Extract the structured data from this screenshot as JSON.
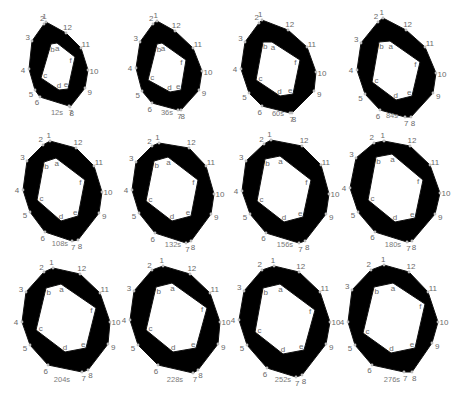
{
  "figure": {
    "title": "",
    "ring_color": "#000000",
    "label_color": "#6a6a6a",
    "outer_vertex_labels": [
      "1",
      "2",
      "3",
      "4",
      "5",
      "6",
      "7",
      "8",
      "9",
      "10",
      "11",
      "12"
    ],
    "inner_vertex_labels": [
      "a",
      "b",
      "c",
      "d",
      "e",
      "f"
    ],
    "panels": [
      {
        "time": "12s",
        "label_pos": [
          57,
          115
        ],
        "outer": [
          [
            46,
            22
          ],
          [
            44,
            24
          ],
          [
            32,
            41
          ],
          [
            29,
            69
          ],
          [
            35,
            90
          ],
          [
            40,
            97
          ],
          [
            69,
            106
          ],
          [
            70,
            107
          ],
          [
            85,
            88
          ],
          [
            88,
            70
          ],
          [
            81,
            48
          ],
          [
            66,
            33
          ]
        ],
        "inner": [
          [
            57,
            43
          ],
          [
            51,
            44
          ],
          [
            41,
            78
          ],
          [
            59,
            90
          ],
          [
            68,
            89
          ],
          [
            75,
            57
          ]
        ]
      },
      {
        "time": "36s",
        "label_pos": [
          167,
          115
        ],
        "outer": [
          [
            157,
            21
          ],
          [
            153,
            24
          ],
          [
            140,
            42
          ],
          [
            136,
            68
          ],
          [
            142,
            91
          ],
          [
            152,
            103
          ],
          [
            178,
            110
          ],
          [
            181,
            110
          ],
          [
            199,
            90
          ],
          [
            202,
            71
          ],
          [
            193,
            48
          ],
          [
            175,
            31
          ]
        ],
        "inner": [
          [
            162,
            43
          ],
          [
            157,
            44
          ],
          [
            148,
            80
          ],
          [
            170,
            92
          ],
          [
            181,
            90
          ],
          [
            186,
            60
          ]
        ]
      },
      {
        "time": "60s",
        "label_pos": [
          278,
          116
        ],
        "outer": [
          [
            262,
            20
          ],
          [
            259,
            23
          ],
          [
            245,
            42
          ],
          [
            241,
            69
          ],
          [
            249,
            93
          ],
          [
            262,
            106
          ],
          [
            290,
            113
          ],
          [
            292,
            113
          ],
          [
            314,
            91
          ],
          [
            316,
            72
          ],
          [
            307,
            47
          ],
          [
            288,
            30
          ]
        ],
        "inner": [
          [
            272,
            42
          ],
          [
            263,
            42
          ],
          [
            256,
            80
          ],
          [
            280,
            96
          ],
          [
            293,
            94
          ],
          [
            300,
            60
          ]
        ]
      },
      {
        "time": "84s",
        "label_pos": [
          392,
          118
        ],
        "outer": [
          [
            383,
            18
          ],
          [
            378,
            22
          ],
          [
            361,
            43
          ],
          [
            357,
            70
          ],
          [
            365,
            94
          ],
          [
            380,
            110
          ],
          [
            405,
            117
          ],
          [
            411,
            117
          ],
          [
            433,
            93
          ],
          [
            436,
            73
          ],
          [
            425,
            47
          ],
          [
            406,
            30
          ]
        ],
        "inner": [
          [
            390,
            41
          ],
          [
            379,
            42
          ],
          [
            372,
            82
          ],
          [
            396,
            100
          ],
          [
            412,
            96
          ],
          [
            420,
            62
          ]
        ]
      },
      {
        "time": "108s",
        "label_pos": [
          60,
          246
        ],
        "outer": [
          [
            50,
            141
          ],
          [
            43,
            145
          ],
          [
            27,
            161
          ],
          [
            23,
            190
          ],
          [
            30,
            212
          ],
          [
            45,
            232
          ],
          [
            72,
            241
          ],
          [
            78,
            240
          ],
          [
            99,
            213
          ],
          [
            102,
            192
          ],
          [
            94,
            166
          ],
          [
            76,
            148
          ]
        ],
        "inner": [
          [
            56,
            158
          ],
          [
            44,
            162
          ],
          [
            37,
            200
          ],
          [
            61,
            221
          ],
          [
            78,
            216
          ],
          [
            85,
            180
          ]
        ]
      },
      {
        "time": "132s",
        "label_pos": [
          173,
          247
        ],
        "outer": [
          [
            159,
            143
          ],
          [
            152,
            146
          ],
          [
            136,
            162
          ],
          [
            132,
            190
          ],
          [
            139,
            213
          ],
          [
            155,
            233
          ],
          [
            186,
            243
          ],
          [
            191,
            241
          ],
          [
            211,
            214
          ],
          [
            214,
            194
          ],
          [
            206,
            166
          ],
          [
            189,
            148
          ]
        ],
        "inner": [
          [
            168,
            157
          ],
          [
            154,
            161
          ],
          [
            146,
            201
          ],
          [
            172,
            221
          ],
          [
            191,
            216
          ],
          [
            198,
            180
          ]
        ]
      },
      {
        "time": "156s",
        "label_pos": [
          285,
          247
        ],
        "outer": [
          [
            271,
            140
          ],
          [
            264,
            144
          ],
          [
            246,
            161
          ],
          [
            242,
            191
          ],
          [
            250,
            214
          ],
          [
            266,
            233
          ],
          [
            299,
            243
          ],
          [
            305,
            241
          ],
          [
            326,
            214
          ],
          [
            329,
            194
          ],
          [
            321,
            165
          ],
          [
            302,
            146
          ]
        ],
        "inner": [
          [
            280,
            156
          ],
          [
            265,
            159
          ],
          [
            257,
            201
          ],
          [
            284,
            222
          ],
          [
            303,
            217
          ],
          [
            311,
            180
          ]
        ]
      },
      {
        "time": "180s",
        "label_pos": [
          393,
          247
        ],
        "outer": [
          [
            384,
            141
          ],
          [
            374,
            143
          ],
          [
            356,
            158
          ],
          [
            350,
            188
          ],
          [
            358,
            212
          ],
          [
            375,
            232
          ],
          [
            407,
            242
          ],
          [
            412,
            241
          ],
          [
            435,
            214
          ],
          [
            440,
            193
          ],
          [
            430,
            165
          ],
          [
            410,
            146
          ]
        ],
        "inner": [
          [
            392,
            154
          ],
          [
            376,
            157
          ],
          [
            368,
            200
          ],
          [
            395,
            222
          ],
          [
            415,
            218
          ],
          [
            423,
            180
          ]
        ]
      },
      {
        "time": "204s",
        "label_pos": [
          62,
          382
        ],
        "outer": [
          [
            53,
            268
          ],
          [
            44,
            272
          ],
          [
            26,
            292
          ],
          [
            22,
            322
          ],
          [
            30,
            345
          ],
          [
            48,
            365
          ],
          [
            82,
            372
          ],
          [
            88,
            370
          ],
          [
            108,
            344
          ],
          [
            110,
            322
          ],
          [
            100,
            293
          ],
          [
            80,
            274
          ]
        ],
        "inner": [
          [
            61,
            284
          ],
          [
            46,
            288
          ],
          [
            36,
            330
          ],
          [
            65,
            352
          ],
          [
            86,
            348
          ],
          [
            96,
            308
          ]
        ]
      },
      {
        "time": "228s",
        "label_pos": [
          175,
          382
        ],
        "outer": [
          [
            163,
            266
          ],
          [
            152,
            270
          ],
          [
            134,
            291
          ],
          [
            130,
            320
          ],
          [
            138,
            345
          ],
          [
            158,
            365
          ],
          [
            193,
            373
          ],
          [
            198,
            370
          ],
          [
            218,
            344
          ],
          [
            220,
            322
          ],
          [
            210,
            293
          ],
          [
            190,
            274
          ]
        ],
        "inner": [
          [
            172,
            283
          ],
          [
            156,
            287
          ],
          [
            146,
            330
          ],
          [
            173,
            352
          ],
          [
            196,
            348
          ],
          [
            207,
            308
          ]
        ]
      },
      {
        "time": "252s",
        "label_pos": [
          283,
          382
        ],
        "outer": [
          [
            274,
            266
          ],
          [
            262,
            270
          ],
          [
            244,
            291
          ],
          [
            239,
            320
          ],
          [
            247,
            345
          ],
          [
            267,
            368
          ],
          [
            296,
            377
          ],
          [
            302,
            375
          ],
          [
            326,
            344
          ],
          [
            330,
            322
          ],
          [
            320,
            292
          ],
          [
            299,
            272
          ]
        ],
        "inner": [
          [
            280,
            284
          ],
          [
            263,
            288
          ],
          [
            255,
            332
          ],
          [
            283,
            354
          ],
          [
            304,
            350
          ],
          [
            315,
            310
          ]
        ]
      },
      {
        "time": "276s",
        "label_pos": [
          392,
          382
        ],
        "outer": [
          [
            384,
            265
          ],
          [
            371,
            270
          ],
          [
            352,
            290
          ],
          [
            348,
            322
          ],
          [
            355,
            345
          ],
          [
            372,
            365
          ],
          [
            404,
            372
          ],
          [
            412,
            372
          ],
          [
            432,
            343
          ],
          [
            438,
            322
          ],
          [
            428,
            292
          ],
          [
            409,
            272
          ]
        ],
        "inner": [
          [
            393,
            283
          ],
          [
            374,
            287
          ],
          [
            363,
            333
          ],
          [
            391,
            353
          ],
          [
            415,
            348
          ],
          [
            425,
            304
          ]
        ]
      }
    ]
  }
}
